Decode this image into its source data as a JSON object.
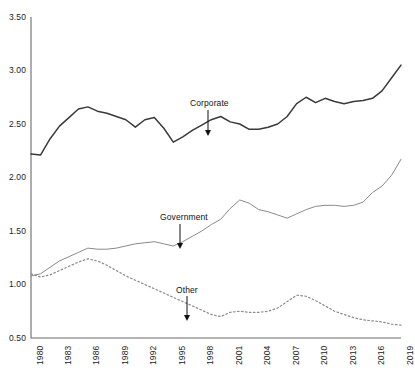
{
  "chart_data": {
    "type": "line",
    "title": "",
    "subtitle": "",
    "xlabel": "",
    "ylabel": "",
    "xlim": [
      1980,
      2019
    ],
    "ylim": [
      0.5,
      3.5
    ],
    "grid": false,
    "legend_position": "inline-annotations",
    "ytick_labels": [
      "3.50",
      "3.00",
      "2.50",
      "2.00",
      "1.50",
      "1.00",
      "0.50"
    ],
    "ytick_values": [
      3.5,
      3.0,
      2.5,
      2.0,
      1.5,
      1.0,
      0.5
    ],
    "xtick_labels": [
      "1980",
      "1983",
      "1986",
      "1989",
      "1992",
      "1995",
      "1998",
      "2001",
      "2004",
      "2007",
      "2010",
      "2013",
      "2016",
      "2019"
    ],
    "xtick_values": [
      1980,
      1983,
      1986,
      1989,
      1992,
      1995,
      1998,
      2001,
      2004,
      2007,
      2010,
      2013,
      2016,
      2019
    ],
    "x": [
      1980,
      1981,
      1982,
      1983,
      1984,
      1985,
      1986,
      1987,
      1988,
      1989,
      1990,
      1991,
      1992,
      1993,
      1994,
      1995,
      1996,
      1997,
      1998,
      1999,
      2000,
      2001,
      2002,
      2003,
      2004,
      2005,
      2006,
      2007,
      2008,
      2009,
      2010,
      2011,
      2012,
      2013,
      2014,
      2015,
      2016,
      2017,
      2018,
      2019
    ],
    "series": [
      {
        "name": "Corporate",
        "style": "solid",
        "color": "#3a3a3a",
        "width": 1.5,
        "values": [
          2.22,
          2.21,
          2.36,
          2.48,
          2.56,
          2.64,
          2.66,
          2.62,
          2.6,
          2.57,
          2.54,
          2.47,
          2.54,
          2.56,
          2.46,
          2.33,
          2.38,
          2.44,
          2.49,
          2.54,
          2.57,
          2.52,
          2.5,
          2.45,
          2.45,
          2.47,
          2.5,
          2.57,
          2.69,
          2.75,
          2.7,
          2.74,
          2.71,
          2.69,
          2.71,
          2.72,
          2.74,
          2.81,
          2.93,
          3.05
        ]
      },
      {
        "name": "Government",
        "style": "solid",
        "color": "#8a8a8a",
        "width": 1.0,
        "values": [
          1.08,
          1.1,
          1.16,
          1.22,
          1.26,
          1.3,
          1.34,
          1.33,
          1.33,
          1.34,
          1.36,
          1.38,
          1.39,
          1.4,
          1.38,
          1.36,
          1.4,
          1.45,
          1.5,
          1.56,
          1.61,
          1.71,
          1.79,
          1.76,
          1.7,
          1.68,
          1.65,
          1.62,
          1.66,
          1.7,
          1.73,
          1.74,
          1.74,
          1.73,
          1.74,
          1.77,
          1.86,
          1.92,
          2.02,
          2.17
        ]
      },
      {
        "name": "Other",
        "style": "dotted",
        "color": "#8a8a8a",
        "width": 1.2,
        "values": [
          1.1,
          1.07,
          1.09,
          1.13,
          1.17,
          1.21,
          1.24,
          1.22,
          1.18,
          1.13,
          1.08,
          1.04,
          1.0,
          0.96,
          0.92,
          0.88,
          0.84,
          0.8,
          0.76,
          0.72,
          0.7,
          0.74,
          0.75,
          0.74,
          0.74,
          0.75,
          0.78,
          0.84,
          0.9,
          0.89,
          0.85,
          0.8,
          0.75,
          0.72,
          0.69,
          0.67,
          0.66,
          0.65,
          0.63,
          0.62
        ]
      }
    ],
    "annotations": [
      {
        "label": "Corporate",
        "x_label": 1995,
        "label_x": 190,
        "label_y": 98,
        "arrow_x": 208,
        "arrow_y0": 110,
        "arrow_y1": 136
      },
      {
        "label": "Government",
        "x_label": 1995,
        "label_x": 160,
        "label_y": 212,
        "arrow_x": 180,
        "arrow_y0": 224,
        "arrow_y1": 249
      },
      {
        "label": "Other",
        "x_label": 1995,
        "label_x": 176,
        "label_y": 285,
        "arrow_x": 187,
        "arrow_y0": 296,
        "arrow_y1": 321
      }
    ],
    "axis": {
      "color": "#6b6b6b",
      "left_px": 31,
      "right_px": 401,
      "top_px": 17,
      "bottom_px": 338
    }
  }
}
